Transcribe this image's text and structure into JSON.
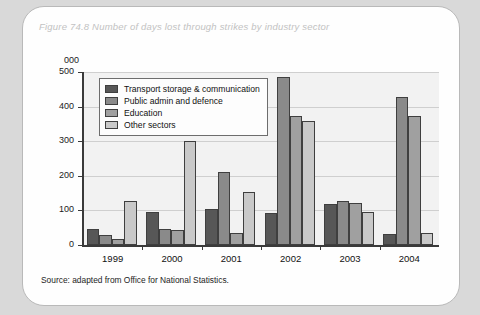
{
  "figure": {
    "title": "Figure 74.8 Number of days lost through strikes by industry sector",
    "source": "Source: adapted from Office for National Statistics.",
    "axis_unit_label": "000"
  },
  "chart_data": {
    "type": "bar",
    "title": "Figure 74.8 Number of days lost through strikes by industry sector",
    "xlabel": "",
    "ylabel": "000",
    "ylim": [
      0,
      500
    ],
    "yticks": [
      0,
      100,
      200,
      300,
      400,
      500
    ],
    "grid": true,
    "legend_position": "upper-left-inside",
    "categories": [
      "1999",
      "2000",
      "2001",
      "2002",
      "2003",
      "2004"
    ],
    "series": [
      {
        "name": "Transport storage & communication",
        "color": "#575757",
        "values": [
          47,
          95,
          103,
          92,
          118,
          33
        ]
      },
      {
        "name": "Public admin and defence",
        "color": "#8a8a8a",
        "values": [
          30,
          45,
          211,
          487,
          126,
          427
        ]
      },
      {
        "name": "Education",
        "color": "#a0a0a0",
        "values": [
          18,
          42,
          35,
          372,
          122,
          372
        ]
      },
      {
        "name": "Other sectors",
        "color": "#c9c9c9",
        "values": [
          128,
          300,
          152,
          357,
          94,
          36
        ]
      }
    ]
  }
}
